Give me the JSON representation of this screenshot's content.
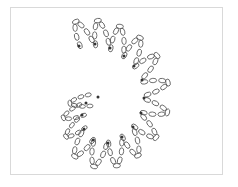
{
  "diagram": {
    "colors": {
      "stroke": "#555555",
      "dot": "#333333",
      "frame": "#d9d9d9",
      "background": "#ffffff"
    },
    "dots": [
      [
        79,
        46
      ],
      [
        95,
        44
      ],
      [
        110,
        48
      ],
      [
        124,
        56
      ],
      [
        134,
        66
      ],
      [
        142,
        80
      ],
      [
        144,
        98
      ],
      [
        141,
        113
      ],
      [
        133,
        127
      ],
      [
        122,
        137
      ],
      [
        108,
        143
      ],
      [
        93,
        140
      ],
      [
        84,
        129
      ],
      [
        82,
        115
      ],
      [
        86,
        103
      ],
      [
        98,
        97
      ]
    ],
    "petal_loops": 7,
    "petal_length": 24,
    "petal_width": 11
  }
}
